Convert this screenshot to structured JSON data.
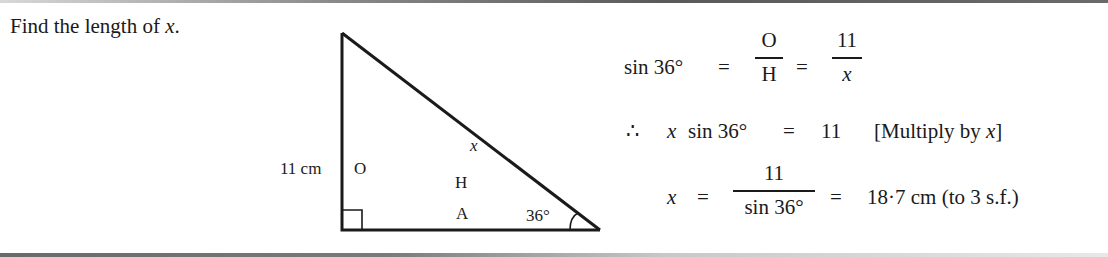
{
  "prompt": {
    "text_before": "Find the length of ",
    "variable": "x",
    "text_after": "."
  },
  "diagram": {
    "type": "right-triangle",
    "side_label_left": "11 cm",
    "label_opposite": "O",
    "label_hypotenuse": "H",
    "label_adjacent": "A",
    "label_hyp_var": "x",
    "angle_label": "36°",
    "right_angle_marker": true
  },
  "solution": {
    "line1": {
      "lhs": "sin 36°",
      "eq": "=",
      "frac1_num": "O",
      "frac1_den": "H",
      "eq2": "=",
      "frac2_num": "11",
      "frac2_den": "x"
    },
    "line2": {
      "therefore": "∴",
      "var": "x",
      "expr": "sin 36°",
      "eq": "=",
      "rhs": "11",
      "note_open": "[Multiply by ",
      "note_var": "x",
      "note_close": "]"
    },
    "line3": {
      "var": "x",
      "eq": "=",
      "frac_num": "11",
      "frac_den": "sin 36°",
      "eq2": "=",
      "result": "18·7 cm (to 3 s.f.)"
    }
  }
}
